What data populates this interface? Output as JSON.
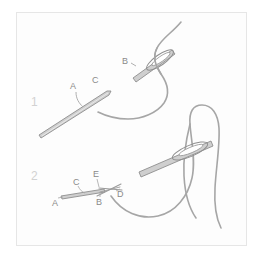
{
  "figure": {
    "background_color": "#ffffff",
    "panel_background_color": "#fdfdfd",
    "panel_border_color": "#e6e6e6",
    "line_color": "#9a9a9a",
    "needle_fill_color": "#cfcfcf",
    "needle_stroke_color": "#8f8f8f",
    "thread_color": "#a6a6a6",
    "label_color": "#8a8a8a",
    "step_number_color": "#d2d2d2"
  },
  "steps": [
    {
      "number": "1",
      "labels": [
        {
          "id": "A",
          "text": "A"
        },
        {
          "id": "B",
          "text": "B"
        },
        {
          "id": "C",
          "text": "C"
        }
      ]
    },
    {
      "number": "2",
      "labels": [
        {
          "id": "A",
          "text": "A"
        },
        {
          "id": "B",
          "text": "B"
        },
        {
          "id": "C",
          "text": "C"
        },
        {
          "id": "D",
          "text": "D"
        },
        {
          "id": "E",
          "text": "E"
        }
      ]
    }
  ]
}
